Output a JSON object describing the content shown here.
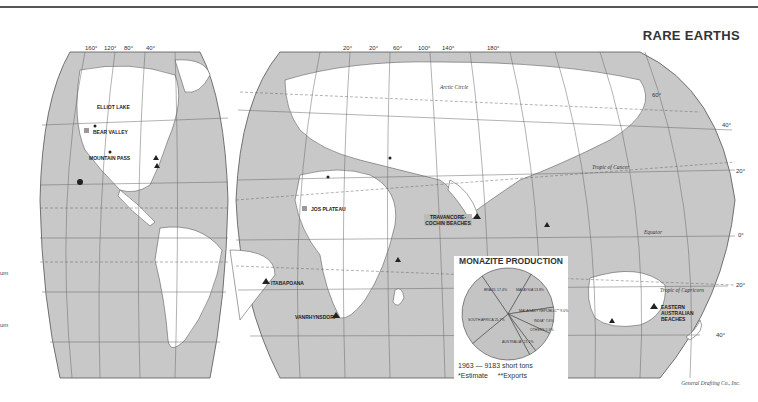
{
  "header": {
    "title": "RARE EARTHS"
  },
  "credit": "General Drafting Co., Inc.",
  "colors": {
    "ocean": "#c8c8c8",
    "land": "#ffffff",
    "grid": "#666666",
    "marker": "#222222"
  },
  "longitude_ticks_west": [
    "160°",
    "120°",
    "80°",
    "40°"
  ],
  "longitude_ticks_east": [
    "20°",
    "20°",
    "60°",
    "100°",
    "140°",
    "180°"
  ],
  "latitude_ticks": [
    "60°",
    "40°",
    "20°",
    "0°",
    "20°",
    "40°"
  ],
  "parallels": {
    "arctic": "Arctic Circle",
    "cancer": "Tropic of Cancer",
    "equator": "Equator",
    "capricorn": "Tropic of Capricorn"
  },
  "sites": [
    {
      "name": "ELLIOT LAKE"
    },
    {
      "name": "BEAR VALLEY"
    },
    {
      "name": "MOUNTAIN PASS"
    },
    {
      "name": "JOS PLATEAU"
    },
    {
      "name": "TRAVANCORE-COCHIN BEACHES"
    },
    {
      "name": "ITABAPOANA"
    },
    {
      "name": "VANRHYNSDORP"
    },
    {
      "name": "EASTERN AUSTRALIAN BEACHES"
    }
  ],
  "legend_fragments": [
    "um",
    "um"
  ],
  "chart_data": {
    "type": "pie",
    "title": "MONAZITE PRODUCTION",
    "subtitle": "1963 — 9183 short tons",
    "footnotes": [
      "*Estimate",
      "**Exports"
    ],
    "slices": [
      {
        "label": "BRAZIL",
        "value": 17.4
      },
      {
        "label": "MALAYSIA",
        "value": 13.8
      },
      {
        "label": "MALAGASY REPUBLIC**",
        "value": 9.0
      },
      {
        "label": "INDIA*",
        "value": 7.6
      },
      {
        "label": "OTHERS",
        "value": 2.4
      },
      {
        "label": "AUSTRALIA*",
        "value": 21.1
      },
      {
        "label": "SOUTH AFRICA",
        "value": 25.7
      }
    ],
    "slice_text": [
      "BRAZIL 17.4%",
      "MALAYSIA 13.8%",
      "MALAGASY REPUBLIC** 9.0%",
      "INDIA* 7.6%",
      "OTHERS 2.4%",
      "AUSTRALIA* 21.1%",
      "SOUTH AFRICA 25.7%"
    ]
  }
}
